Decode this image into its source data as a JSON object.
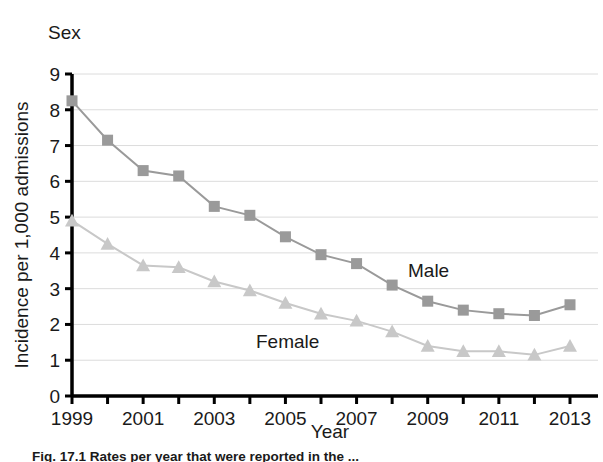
{
  "chart_title": "Sex",
  "caption": "Fig. 17.1  Rates per year that were reported in the ...",
  "chart_data": {
    "type": "line",
    "title": "Sex",
    "xlabel": "Year",
    "ylabel": "Incidence per 1,000 admissions",
    "x": [
      1999,
      2000,
      2001,
      2002,
      2003,
      2004,
      2005,
      2006,
      2007,
      2008,
      2009,
      2010,
      2011,
      2012,
      2013
    ],
    "xtick_labels": [
      "1999",
      "",
      "2001",
      "",
      "2003",
      "",
      "2005",
      "",
      "2007",
      "",
      "2009",
      "",
      "2011",
      "",
      "2013"
    ],
    "ytick_labels": [
      "0",
      "1",
      "2",
      "3",
      "4",
      "5",
      "6",
      "7",
      "8",
      "9"
    ],
    "xlim": [
      1999,
      2013
    ],
    "ylim": [
      0,
      9
    ],
    "grid": "horizontal",
    "legend_position": "inline-annotations",
    "series": [
      {
        "name": "Male",
        "marker": "square",
        "color": "#9a9a9a",
        "label_text": "Male",
        "values": [
          8.25,
          7.15,
          6.3,
          6.15,
          5.3,
          5.05,
          4.45,
          3.95,
          3.7,
          3.1,
          2.65,
          2.4,
          2.3,
          2.25,
          2.55
        ]
      },
      {
        "name": "Female",
        "marker": "triangle",
        "color": "#c8c8c8",
        "label_text": "Female",
        "values": [
          4.9,
          4.25,
          3.65,
          3.6,
          3.2,
          2.95,
          2.6,
          2.3,
          2.1,
          1.8,
          1.4,
          1.25,
          1.25,
          1.15,
          1.4
        ]
      }
    ]
  }
}
